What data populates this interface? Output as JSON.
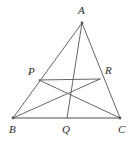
{
  "figure": {
    "width": 136,
    "height": 143,
    "background_color": "#ffffff",
    "stroke_color": "#55545a",
    "baseline_color": "#8a8a90",
    "label_color": "#2b2b2b",
    "stroke_width": 0.9,
    "baseline_width": 1.6,
    "vertex_dot_radius": 1.4
  },
  "points": {
    "A": {
      "label": "A",
      "x": 82,
      "y": 23,
      "label_x": 78,
      "label_y": 5,
      "marker": true
    },
    "B": {
      "label": "B",
      "x": 13,
      "y": 118,
      "label_x": 9,
      "label_y": 124,
      "marker": true
    },
    "C": {
      "label": "C",
      "x": 120,
      "y": 118,
      "label_x": 118,
      "label_y": 124,
      "marker": true
    },
    "P": {
      "label": "P",
      "x": 39,
      "y": 80,
      "label_x": 28,
      "label_y": 66,
      "marker": false
    },
    "Q": {
      "label": "Q",
      "x": 67,
      "y": 118,
      "label_x": 62,
      "label_y": 124,
      "marker": false
    },
    "R": {
      "label": "R",
      "x": 100,
      "y": 79,
      "label_x": 105,
      "label_y": 65,
      "marker": false
    },
    "G": {
      "label": "",
      "x": 68,
      "y": 96,
      "label_x": 0,
      "label_y": 0,
      "marker": false
    }
  },
  "segments": [
    {
      "name": "side-AB",
      "from": "A",
      "to": "B",
      "kind": "side"
    },
    {
      "name": "side-AC",
      "from": "A",
      "to": "C",
      "kind": "side"
    },
    {
      "name": "side-BC",
      "from": "B",
      "to": "C",
      "kind": "baseline"
    },
    {
      "name": "cevian-AQ",
      "from": "A",
      "to": "Q",
      "kind": "cevian"
    },
    {
      "name": "cevian-BR",
      "from": "B",
      "to": "R",
      "kind": "cevian"
    },
    {
      "name": "cevian-CP",
      "from": "C",
      "to": "P",
      "kind": "cevian"
    },
    {
      "name": "segment-PR",
      "from": "P",
      "to": "R",
      "kind": "chord"
    }
  ],
  "labels": [
    "A",
    "P",
    "R",
    "B",
    "Q",
    "C"
  ]
}
